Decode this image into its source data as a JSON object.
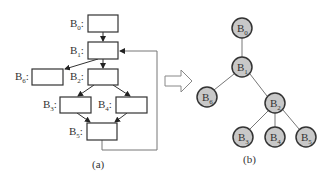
{
  "figure": {
    "left_caption": "(a)",
    "right_caption": "(b)",
    "colors": {
      "stroke": "#333333",
      "edge": "#777777",
      "node_fill": "#c8c8c8",
      "box_fill": "#ffffff"
    }
  },
  "flow_graph": {
    "blocks": [
      {
        "id": "B0",
        "base": "B",
        "sub": "0",
        "colon": ":"
      },
      {
        "id": "B1",
        "base": "B",
        "sub": "1",
        "colon": ":"
      },
      {
        "id": "B6",
        "base": "B",
        "sub": "6",
        "colon": ":"
      },
      {
        "id": "B2",
        "base": "B",
        "sub": "2",
        "colon": ":"
      },
      {
        "id": "B3",
        "base": "B",
        "sub": "3",
        "colon": ":"
      },
      {
        "id": "B4",
        "base": "B",
        "sub": "4",
        "colon": ":"
      },
      {
        "id": "B5",
        "base": "B",
        "sub": "5",
        "colon": ":"
      }
    ],
    "edges": [
      [
        "B0",
        "B1"
      ],
      [
        "B1",
        "B6"
      ],
      [
        "B1",
        "B2"
      ],
      [
        "B2",
        "B3"
      ],
      [
        "B2",
        "B4"
      ],
      [
        "B3",
        "B5"
      ],
      [
        "B4",
        "B5"
      ],
      [
        "B5",
        "B1"
      ]
    ]
  },
  "transform_arrow": "hollow-right-arrow",
  "tree": {
    "nodes": [
      {
        "id": "B0",
        "base": "B",
        "sub": "0"
      },
      {
        "id": "B1",
        "base": "B",
        "sub": "1"
      },
      {
        "id": "B6",
        "base": "B",
        "sub": "6"
      },
      {
        "id": "B2",
        "base": "B",
        "sub": "2"
      },
      {
        "id": "B3",
        "base": "B",
        "sub": "3"
      },
      {
        "id": "B4",
        "base": "B",
        "sub": "4"
      },
      {
        "id": "B5",
        "base": "B",
        "sub": "5"
      }
    ],
    "edges": [
      [
        "B0",
        "B1"
      ],
      [
        "B1",
        "B6"
      ],
      [
        "B1",
        "B2"
      ],
      [
        "B2",
        "B3"
      ],
      [
        "B2",
        "B4"
      ],
      [
        "B2",
        "B5"
      ]
    ]
  }
}
